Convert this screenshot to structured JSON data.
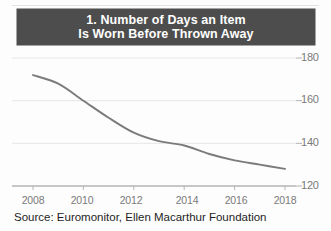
{
  "figure": {
    "title_lines": [
      "1. Number of Days an Item",
      "Is Worn Before Thrown Away"
    ],
    "source": "Source: Euromonitor, Ellen Macarthur Foundation",
    "colors": {
      "title_band_bg": "#4d4d4d",
      "title_text": "#ffffff",
      "line": "#7b7b7b",
      "gridline": "#e6e6e6",
      "axis": "#b4b4b4",
      "tick_text": "#7a7a7a",
      "background": "#fdfdfd"
    }
  },
  "chart_data": {
    "type": "line",
    "title": "1. Number of Days an Item Is Worn Before Thrown Away",
    "xlabel": "",
    "ylabel": "",
    "xlim": [
      2008,
      2018
    ],
    "ylim": [
      120,
      180
    ],
    "grid": true,
    "legend": "none",
    "xticks": [
      2008,
      2010,
      2012,
      2014,
      2016,
      2018
    ],
    "xtick_labels": [
      "2008",
      "2010",
      "2012",
      "2014",
      "2016",
      "2018"
    ],
    "yticks": [
      120,
      140,
      160,
      180
    ],
    "ytick_labels": [
      "120",
      "140",
      "160",
      "180"
    ],
    "ytick_side": "right",
    "x": [
      2008,
      2009,
      2010,
      2011,
      2012,
      2013,
      2014,
      2015,
      2016,
      2017,
      2018
    ],
    "values": [
      172,
      168,
      160,
      152,
      145,
      141,
      139,
      135,
      132,
      130,
      128
    ],
    "series": [
      {
        "name": "Days an item is worn before thrown away",
        "values": [
          172,
          168,
          160,
          152,
          145,
          141,
          139,
          135,
          132,
          130,
          128
        ]
      }
    ],
    "annotations": []
  }
}
